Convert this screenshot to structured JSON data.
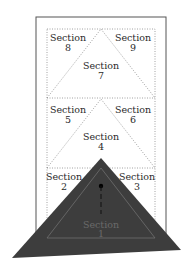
{
  "diagram": {
    "type": "quilt-folding-layout",
    "sections": [
      {
        "id": "section-1",
        "line1": "Section",
        "line2": "1"
      },
      {
        "id": "section-2",
        "line1": "Section",
        "line2": "2"
      },
      {
        "id": "section-3",
        "line1": "Section",
        "line2": "3"
      },
      {
        "id": "section-4",
        "line1": "Section",
        "line2": "4"
      },
      {
        "id": "section-5",
        "line1": "Section",
        "line2": "5"
      },
      {
        "id": "section-6",
        "line1": "Section",
        "line2": "6"
      },
      {
        "id": "section-7",
        "line1": "Section",
        "line2": "7"
      },
      {
        "id": "section-8",
        "line1": "Section",
        "line2": "8"
      },
      {
        "id": "section-9",
        "line1": "Section",
        "line2": "9"
      }
    ],
    "colors": {
      "frame": "#555555",
      "dotted": "#8a8a8a",
      "overlay_triangle": "#3d3d3d",
      "overlay_inner_line": "#6e6e6e",
      "background": "#ffffff"
    }
  }
}
